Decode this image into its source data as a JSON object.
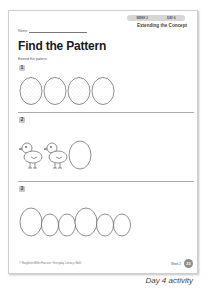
{
  "header": {
    "week_label": "WEEK 2",
    "day_label": "DAY 4",
    "concept": "Extending the Concept",
    "name_label": "Name"
  },
  "title": "Find the Pattern",
  "instruction": "Extend the pattern.",
  "problems": [
    {
      "number": "1",
      "items": [
        "speckled-egg",
        "plain-egg",
        "speckled-egg",
        "plain-egg"
      ]
    },
    {
      "number": "2",
      "items": [
        "chick",
        "chick",
        "egg"
      ]
    },
    {
      "number": "3",
      "items": [
        "big-egg",
        "small-egg",
        "small-egg",
        "big-egg",
        "small-egg",
        "small-egg"
      ]
    }
  ],
  "footer": {
    "copyright": "© Houghton Mifflin Harcourt • Everyday Literacy: Math",
    "week": "Week 2",
    "page_number": "23"
  },
  "caption": "Day 4 activity"
}
